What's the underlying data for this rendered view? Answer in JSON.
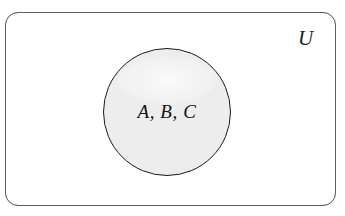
{
  "diagram": {
    "kind": "venn-set-diagram",
    "universe": {
      "label": "U",
      "shape": "rounded-rectangle",
      "border_color": "#6d6d6d",
      "fill_color": "#ffffff"
    },
    "sets": [
      {
        "label": "A, B, C",
        "shape": "circle",
        "fill_color": "#ededed",
        "border_color": "#1a1a1a",
        "members": [
          "A",
          "B",
          "C"
        ]
      }
    ],
    "background_color": "#ffffff"
  }
}
